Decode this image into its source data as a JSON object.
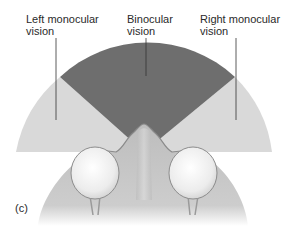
{
  "labels": {
    "left_monocular": "Left monocular\nvision",
    "binocular": "Binocular\nvision",
    "right_monocular": "Right monocular\nvision",
    "panel": "(c)"
  },
  "colors": {
    "background": "#ffffff",
    "monocular_field": "#d9d9d9",
    "binocular_field": "#6e6e6e",
    "head": "#c4c4c4",
    "eye": "#f2f2f2",
    "pointer_line": "#333333"
  },
  "regions": [
    {
      "name": "left-monocular-field",
      "shade": "light"
    },
    {
      "name": "binocular-field",
      "shade": "dark"
    },
    {
      "name": "right-monocular-field",
      "shade": "light"
    }
  ]
}
